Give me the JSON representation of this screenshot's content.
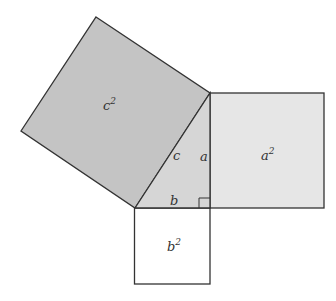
{
  "diagram": {
    "type": "pythagorean-theorem",
    "colors": {
      "c_square": "#c4c4c4",
      "a_square": "#e6e6e6",
      "b_square": "#ffffff",
      "triangle": "#d6d6d6",
      "stroke": "#333333"
    },
    "labels": {
      "c_square": "c",
      "c_square_exp": "2",
      "a_square": "a",
      "a_square_exp": "2",
      "b_square": "b",
      "b_square_exp": "2",
      "side_c": "c",
      "side_a": "a",
      "side_b": "b"
    }
  }
}
